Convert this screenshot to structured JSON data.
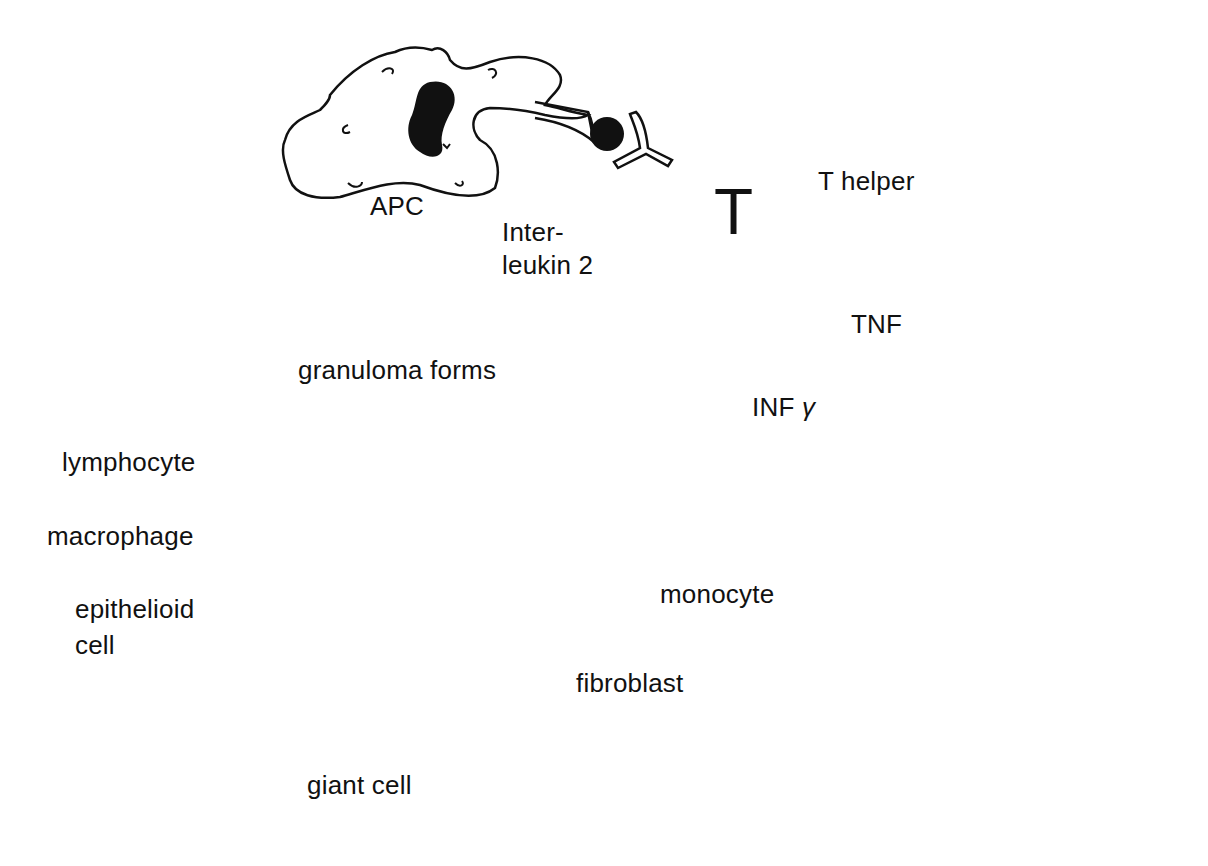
{
  "diagram": {
    "colors": {
      "ink": "#111111",
      "background": "#ffffff"
    },
    "cells": {
      "apc": {
        "label": "APC"
      },
      "t_helper": {
        "label": "T helper",
        "core_letter": "T"
      },
      "monocyte": {
        "label": "monocyte"
      }
    },
    "signals": {
      "interleukin": {
        "line1": "Inter-",
        "line2": "leukin 2"
      },
      "tnf": {
        "label": "TNF"
      },
      "infg": {
        "label": "INF",
        "symbol": "γ"
      }
    },
    "granuloma": {
      "title": "granuloma forms",
      "labels": {
        "lymphocyte": "lymphocyte",
        "macrophage": "macrophage",
        "epithelioid_line1": "epithelioid",
        "epithelioid_line2": "cell",
        "giant_cell": "giant cell",
        "fibroblast": "fibroblast"
      }
    }
  }
}
